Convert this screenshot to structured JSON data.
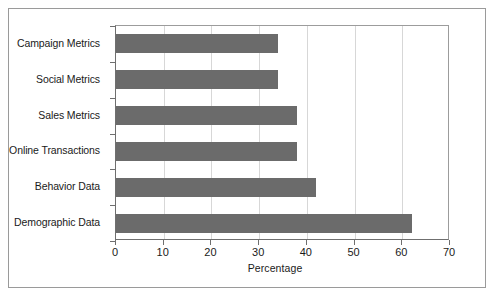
{
  "chart_data": {
    "type": "bar",
    "orientation": "horizontal",
    "title": "",
    "xlabel": "Percentage",
    "ylabel": "",
    "xlim": [
      0,
      70
    ],
    "xticks": [
      0,
      10,
      20,
      30,
      40,
      50,
      60,
      70
    ],
    "grid": "vertical",
    "legend": "none",
    "bar_color": "#6b6b6b",
    "categories": [
      "Campaign Metrics",
      "Social Metrics",
      "Sales Metrics",
      "Online Transactions",
      "Behavior Data",
      "Demographic Data"
    ],
    "values": [
      34,
      34,
      38,
      38,
      42,
      62
    ]
  },
  "figure": {
    "x_axis_title": "Percentage",
    "tick_labels": [
      "0",
      "10",
      "20",
      "30",
      "40",
      "50",
      "60",
      "70"
    ],
    "category_labels": [
      "Campaign Metrics",
      "Social Metrics",
      "Sales Metrics",
      "Online Transactions",
      "Behavior Data",
      "Demographic Data"
    ]
  }
}
